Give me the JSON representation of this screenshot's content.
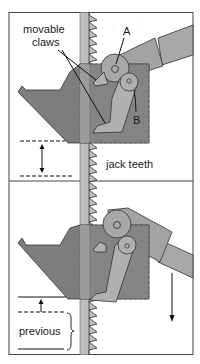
{
  "diagram": {
    "panels": [
      {
        "id": "top",
        "labels": {
          "claws_line1": "movable",
          "claws_line2": "claws",
          "pivot_a": "A",
          "pivot_b": "B",
          "teeth": "jack teeth"
        },
        "annotations": [
          "double-headed vertical arrow between dashed lines"
        ]
      },
      {
        "id": "bottom",
        "labels": {
          "previous": "previous"
        },
        "annotations": [
          "upward arrow from dashed line",
          "downward arrow at right",
          "brace spanning previous"
        ]
      }
    ],
    "colors": {
      "rack": "#bdbdbd",
      "body_dark": "#7d7d7d",
      "claw_light": "#b0b0b0",
      "lever": "#a8a8a8",
      "handle": "#a3a3a3",
      "stroke": "#1a1a1a"
    }
  }
}
